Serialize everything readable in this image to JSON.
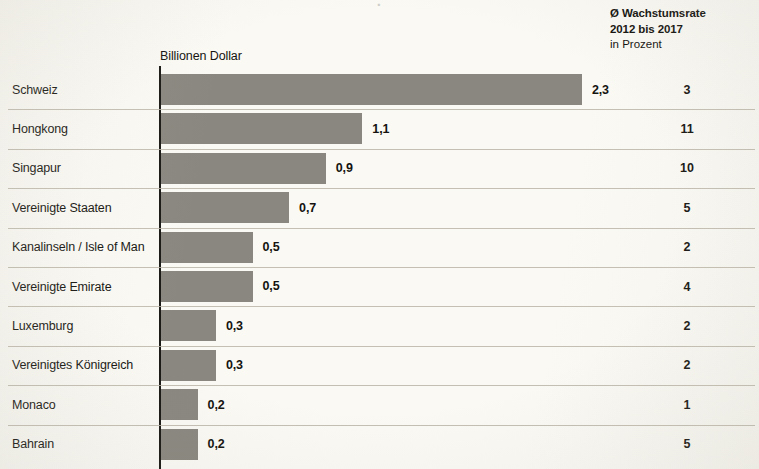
{
  "header": {
    "cropped_title_fragment": "· ",
    "growth_line_1": "Ø Wachstumsrate",
    "growth_line_2": "2012 bis 2017",
    "growth_line_3": "in Prozent",
    "axis_caption": "Billionen Dollar"
  },
  "colors": {
    "bar": "#89877f",
    "background": "#faf9f4",
    "axis": "#1a1915",
    "separator": "#b9b5a6",
    "text": "#14130f"
  },
  "chart_data": {
    "type": "bar",
    "title": "",
    "subtitle": "",
    "orientation": "horizontal",
    "xlabel": "Billionen Dollar",
    "ylabel": "",
    "xlim": [
      0,
      2.3
    ],
    "grid": false,
    "legend": null,
    "value_format": "german-decimal-comma",
    "categories": [
      "Schweiz",
      "Hongkong",
      "Singapur",
      "Vereinigte Staaten",
      "Kanalinseln / Isle of Man",
      "Vereinigte Emirate",
      "Luxemburg",
      "Vereinigtes Königreich",
      "Monaco",
      "Bahrain"
    ],
    "values": [
      2.3,
      1.1,
      0.9,
      0.7,
      0.5,
      0.5,
      0.3,
      0.3,
      0.2,
      0.2
    ],
    "value_labels": [
      "2,3",
      "1,1",
      "0,9",
      "0,7",
      "0,5",
      "0,5",
      "0,3",
      "0,3",
      "0,2",
      "0,2"
    ],
    "secondary_column": {
      "header": [
        "Ø Wachstumsrate",
        "2012 bis 2017",
        "in Prozent"
      ],
      "unit": "Prozent",
      "values": [
        3,
        11,
        10,
        5,
        2,
        4,
        2,
        2,
        1,
        5
      ],
      "value_labels": [
        "3",
        "11",
        "10",
        "5",
        "2",
        "4",
        "2",
        "2",
        "1",
        "5"
      ]
    }
  }
}
